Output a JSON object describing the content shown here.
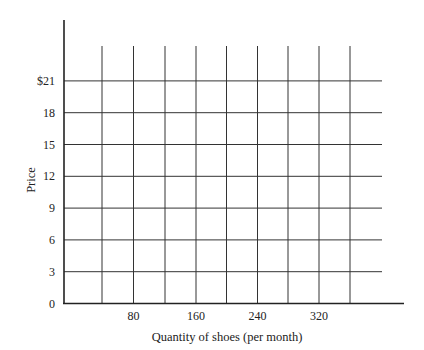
{
  "chart_data": {
    "type": "line",
    "title": "",
    "xlabel": "Quantity of shoes (per month)",
    "ylabel": "Price",
    "x_ticks": [
      80,
      160,
      240,
      320
    ],
    "x_tick_labels": [
      "80",
      "160",
      "240",
      "320"
    ],
    "x_gridlines": [
      40,
      80,
      120,
      160,
      200,
      240,
      280,
      320,
      360
    ],
    "y_ticks": [
      0,
      3,
      6,
      9,
      12,
      15,
      18,
      21
    ],
    "y_tick_labels": [
      "0",
      "3",
      "6",
      "9",
      "12",
      "15",
      "18",
      "$21"
    ],
    "xlim": [
      0,
      400
    ],
    "ylim": [
      0,
      27
    ],
    "grid": true,
    "legend": null,
    "series": []
  },
  "labels": {
    "xlabel": "Quantity of shoes (per month)",
    "ylabel": "Price"
  },
  "colors": {
    "axis": "#222222",
    "grid": "#333333",
    "background": "#ffffff"
  }
}
